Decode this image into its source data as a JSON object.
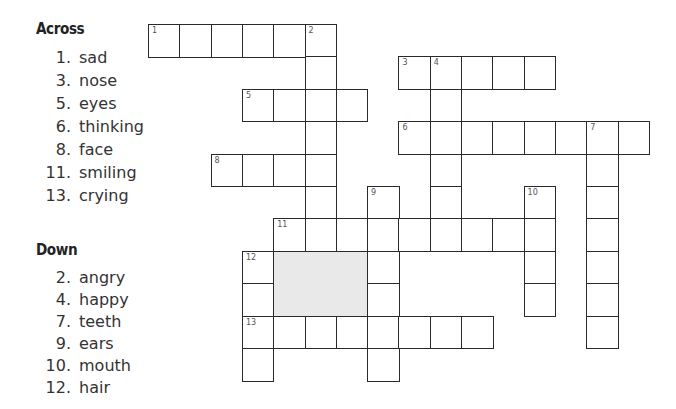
{
  "across": {
    "heading": "Across",
    "clues": [
      {
        "num": "1.",
        "word": "sad"
      },
      {
        "num": "3.",
        "word": "nose"
      },
      {
        "num": "5.",
        "word": "eyes"
      },
      {
        "num": "6.",
        "word": "thinking"
      },
      {
        "num": "8.",
        "word": "face"
      },
      {
        "num": "11.",
        "word": "smiling"
      },
      {
        "num": "13.",
        "word": "crying"
      }
    ]
  },
  "down": {
    "heading": "Down",
    "clues": [
      {
        "num": "2.",
        "word": "angry"
      },
      {
        "num": "4.",
        "word": "happy"
      },
      {
        "num": "7.",
        "word": "teeth"
      },
      {
        "num": "9.",
        "word": "ears"
      },
      {
        "num": "10.",
        "word": "mouth"
      },
      {
        "num": "12.",
        "word": "hair"
      }
    ]
  },
  "grid": {
    "origin_x": 148,
    "origin_y": 24,
    "cell_w": 31.3,
    "cell_h": 32.4,
    "entries": [
      {
        "number": 1,
        "dir": "across",
        "row": 0,
        "col": 0,
        "len": 6
      },
      {
        "number": 2,
        "dir": "down",
        "row": 0,
        "col": 5,
        "len": 7
      },
      {
        "number": 3,
        "dir": "across",
        "row": 1,
        "col": 8,
        "len": 5
      },
      {
        "number": 4,
        "dir": "down",
        "row": 1,
        "col": 9,
        "len": 6
      },
      {
        "number": 5,
        "dir": "across",
        "row": 2,
        "col": 3,
        "len": 4
      },
      {
        "number": 6,
        "dir": "across",
        "row": 3,
        "col": 8,
        "len": 8
      },
      {
        "number": 7,
        "dir": "down",
        "row": 3,
        "col": 14,
        "len": 7
      },
      {
        "number": 8,
        "dir": "across",
        "row": 4,
        "col": 2,
        "len": 4
      },
      {
        "number": 9,
        "dir": "down",
        "row": 5,
        "col": 7,
        "len": 6
      },
      {
        "number": 10,
        "dir": "down",
        "row": 5,
        "col": 12,
        "len": 4
      },
      {
        "number": 11,
        "dir": "across",
        "row": 6,
        "col": 4,
        "len": 9
      },
      {
        "number": 12,
        "dir": "down",
        "row": 7,
        "col": 3,
        "len": 4
      },
      {
        "number": 13,
        "dir": "across",
        "row": 9,
        "col": 3,
        "len": 8
      }
    ],
    "shaded_block": {
      "row": 7,
      "col": 4,
      "rows": 2,
      "cols": 3,
      "color": "#e9e9e9"
    }
  }
}
